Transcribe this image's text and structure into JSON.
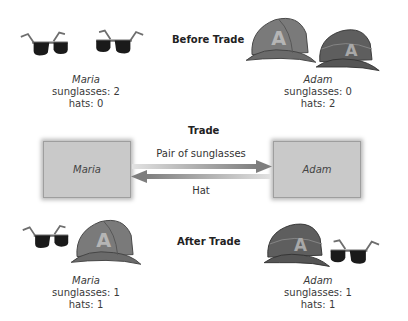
{
  "before": {
    "heading": "Before Trade",
    "maria": {
      "name": "Maria",
      "sunglasses": "sunglasses: 2",
      "hats": "hats: 0"
    },
    "adam": {
      "name": "Adam",
      "sunglasses": "sunglasses: 0",
      "hats": "hats: 2"
    }
  },
  "trade": {
    "heading": "Trade",
    "left_party": "Maria",
    "right_party": "Adam",
    "to_right_label": "Pair of sunglasses",
    "to_left_label": "Hat"
  },
  "after": {
    "heading": "After Trade",
    "maria": {
      "name": "Maria",
      "sunglasses": "sunglasses: 1",
      "hats": "hats: 1"
    },
    "adam": {
      "name": "Adam",
      "sunglasses": "sunglasses: 1",
      "hats": "hats: 1"
    }
  },
  "icons": {
    "sunglasses": "sunglasses-icon",
    "hat": "baseball-cap-icon",
    "hat_letter": "A"
  },
  "colors": {
    "hat": "#7a7a7a",
    "hat_dark": "#5e5e5e",
    "hat_letter": "#b5b5b5",
    "lens": "#1a1a1a",
    "frame": "#6e6e6e",
    "box": "#c9c9c9",
    "arrow": "#8a8a8a"
  }
}
